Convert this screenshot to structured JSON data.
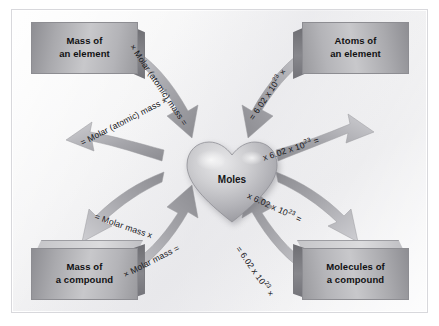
{
  "figure": {
    "center": {
      "shape": "heart",
      "label": "Moles"
    },
    "colors": {
      "background": "#f4f4f5",
      "box_fill": "#c8c8cb",
      "box_edge": "#8d8d92",
      "arrow": "#a0a0a5",
      "text": "#111113"
    },
    "boxes": [
      {
        "id": "mass-of-an-element",
        "line1": "Mass of",
        "line2": "an element",
        "position": "top-left"
      },
      {
        "id": "atoms-of-an-element",
        "line1": "Atoms of",
        "line2": "an element",
        "position": "top-right"
      },
      {
        "id": "mass-of-a-compound",
        "line1": "Mass of",
        "line2": "a compound",
        "position": "bottom-left"
      },
      {
        "id": "molecules-of-a-compound",
        "line1": "Molecules of",
        "line2": "a compound",
        "position": "bottom-right"
      }
    ],
    "arrow_labels": {
      "top_left_down": "× Molar (atomic) mass =",
      "top_left_up": "= Molar (atomic) mass ×",
      "top_right_down": "= 6.02 x 10",
      "top_right_down_exp": "23",
      "top_right_down_tail": " ×",
      "mid_right_up": "x 6.02 x 10",
      "mid_right_up_exp": "23",
      "mid_right_up_tail": " =",
      "mid_left_up": "= Molar mass x",
      "bottom_left_down": "× Molar mass =",
      "bottom_right_up": "x 6.02 x 10",
      "bottom_right_up_exp": "23",
      "bottom_right_up_tail": " =",
      "bottom_right_down": "= 6.02 x 10",
      "bottom_right_down_exp": "23",
      "bottom_right_down_tail": " ×"
    }
  }
}
